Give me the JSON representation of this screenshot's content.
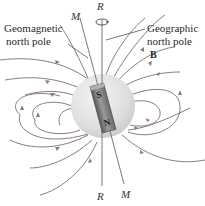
{
  "labels": {
    "geomagnetic": [
      "Geomagnetic",
      "north pole"
    ],
    "geographic": [
      "Geographic",
      "north pole"
    ],
    "field": "B",
    "rotation_axis_top": "R",
    "rotation_axis_bottom": "R",
    "magnetic_axis_top": "M",
    "magnetic_axis_bottom": "M",
    "magnet_south": "S",
    "magnet_north": "N"
  },
  "colors": {
    "field_lines": "#8a7a82",
    "earth": "#e4e4e4",
    "magnet": "#7a7a7a"
  }
}
